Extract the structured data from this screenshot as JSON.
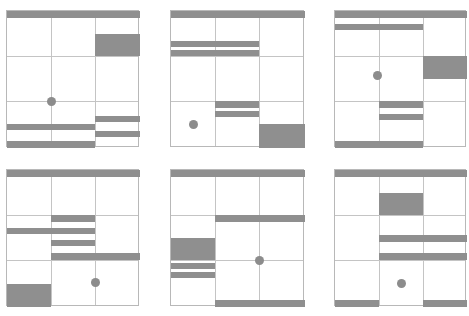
{
  "figure": {
    "colors": {
      "bar": "#8f8f8f",
      "grid": "#c4c4c4",
      "background": "#ffffff"
    },
    "panels": [
      {
        "x": 6,
        "y": 10,
        "w": 133,
        "h": 137,
        "vlines": [
          44,
          88
        ],
        "hlines": [
          45,
          90
        ],
        "shapes": [
          {
            "t": "bar",
            "x": 0,
            "y": 0,
            "w": 133,
            "h": 7
          },
          {
            "t": "blk",
            "x": 88,
            "y": 23,
            "w": 45,
            "h": 22
          },
          {
            "t": "bar",
            "x": 0,
            "y": 113,
            "w": 88,
            "h": 6
          },
          {
            "t": "bar",
            "x": 0,
            "y": 130,
            "w": 88,
            "h": 7
          },
          {
            "t": "bar",
            "x": 88,
            "y": 105,
            "w": 45,
            "h": 6
          },
          {
            "t": "bar",
            "x": 88,
            "y": 120,
            "w": 45,
            "h": 6
          },
          {
            "t": "dot",
            "x": 44,
            "y": 90
          }
        ]
      },
      {
        "x": 170,
        "y": 10,
        "w": 134,
        "h": 137,
        "vlines": [
          44,
          88
        ],
        "hlines": [
          45,
          90
        ],
        "shapes": [
          {
            "t": "bar",
            "x": 0,
            "y": 0,
            "w": 134,
            "h": 7
          },
          {
            "t": "bar",
            "x": 0,
            "y": 30,
            "w": 88,
            "h": 6
          },
          {
            "t": "bar",
            "x": 0,
            "y": 39,
            "w": 88,
            "h": 6
          },
          {
            "t": "bar",
            "x": 44,
            "y": 90,
            "w": 44,
            "h": 7
          },
          {
            "t": "bar",
            "x": 44,
            "y": 100,
            "w": 44,
            "h": 6
          },
          {
            "t": "blk",
            "x": 88,
            "y": 113,
            "w": 46,
            "h": 24
          },
          {
            "t": "dot",
            "x": 22,
            "y": 113
          }
        ]
      },
      {
        "x": 334,
        "y": 10,
        "w": 132,
        "h": 137,
        "vlines": [
          44,
          88
        ],
        "hlines": [
          45,
          90
        ],
        "shapes": [
          {
            "t": "bar",
            "x": 0,
            "y": 0,
            "w": 132,
            "h": 7
          },
          {
            "t": "bar",
            "x": 0,
            "y": 13,
            "w": 88,
            "h": 6
          },
          {
            "t": "blk",
            "x": 88,
            "y": 45,
            "w": 44,
            "h": 23
          },
          {
            "t": "bar",
            "x": 44,
            "y": 90,
            "w": 44,
            "h": 7
          },
          {
            "t": "bar",
            "x": 44,
            "y": 103,
            "w": 44,
            "h": 6
          },
          {
            "t": "bar",
            "x": 0,
            "y": 130,
            "w": 88,
            "h": 7
          },
          {
            "t": "dot",
            "x": 42,
            "y": 64
          }
        ]
      },
      {
        "x": 6,
        "y": 169,
        "w": 133,
        "h": 137,
        "vlines": [
          44,
          88
        ],
        "hlines": [
          45,
          90
        ],
        "shapes": [
          {
            "t": "bar",
            "x": 0,
            "y": 0,
            "w": 133,
            "h": 7
          },
          {
            "t": "bar",
            "x": 44,
            "y": 45,
            "w": 44,
            "h": 7
          },
          {
            "t": "bar",
            "x": 0,
            "y": 58,
            "w": 88,
            "h": 6
          },
          {
            "t": "bar",
            "x": 44,
            "y": 70,
            "w": 44,
            "h": 6
          },
          {
            "t": "bar",
            "x": 44,
            "y": 83,
            "w": 89,
            "h": 7
          },
          {
            "t": "blk",
            "x": 0,
            "y": 114,
            "w": 44,
            "h": 23
          },
          {
            "t": "dot",
            "x": 88,
            "y": 112
          }
        ]
      },
      {
        "x": 170,
        "y": 169,
        "w": 134,
        "h": 137,
        "vlines": [
          44,
          88
        ],
        "hlines": [
          45,
          90
        ],
        "shapes": [
          {
            "t": "bar",
            "x": 0,
            "y": 0,
            "w": 134,
            "h": 7
          },
          {
            "t": "bar",
            "x": 44,
            "y": 45,
            "w": 90,
            "h": 7
          },
          {
            "t": "blk",
            "x": 0,
            "y": 68,
            "w": 44,
            "h": 22
          },
          {
            "t": "bar",
            "x": 0,
            "y": 93,
            "w": 44,
            "h": 6
          },
          {
            "t": "bar",
            "x": 0,
            "y": 102,
            "w": 44,
            "h": 6
          },
          {
            "t": "bar",
            "x": 44,
            "y": 130,
            "w": 90,
            "h": 7
          },
          {
            "t": "dot",
            "x": 88,
            "y": 90
          }
        ]
      },
      {
        "x": 334,
        "y": 169,
        "w": 132,
        "h": 137,
        "vlines": [
          44,
          88
        ],
        "hlines": [
          45,
          90
        ],
        "shapes": [
          {
            "t": "bar",
            "x": 0,
            "y": 0,
            "w": 132,
            "h": 7
          },
          {
            "t": "blk",
            "x": 44,
            "y": 23,
            "w": 44,
            "h": 22
          },
          {
            "t": "bar",
            "x": 44,
            "y": 65,
            "w": 88,
            "h": 7
          },
          {
            "t": "bar",
            "x": 44,
            "y": 83,
            "w": 88,
            "h": 7
          },
          {
            "t": "bar",
            "x": 0,
            "y": 130,
            "w": 44,
            "h": 7
          },
          {
            "t": "bar",
            "x": 88,
            "y": 130,
            "w": 44,
            "h": 7
          },
          {
            "t": "dot",
            "x": 66,
            "y": 113
          }
        ]
      }
    ]
  }
}
